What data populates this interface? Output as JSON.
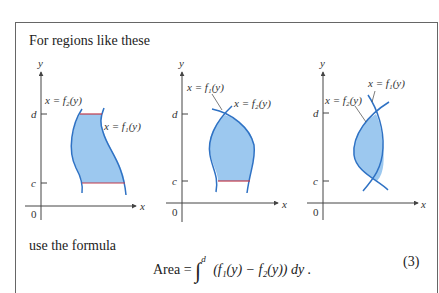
{
  "box": {
    "intro": "For regions like these",
    "use_line": "use the formula",
    "formula": {
      "lhs": "Area = ",
      "integral_upper": "d",
      "integral_lower": "c",
      "integrand": "(f₁(y) − f₂(y)) dy .",
      "equation_number": "(3)"
    }
  },
  "figures": [
    {
      "name": "figure-1",
      "axis_y_label": "y",
      "axis_x_label": "x",
      "origin_label": "0",
      "tick_d": "d",
      "tick_c": "c",
      "curve_labels": [
        "x = f₂(y)",
        "x = f₁(y)"
      ]
    },
    {
      "name": "figure-2",
      "axis_y_label": "y",
      "axis_x_label": "x",
      "origin_label": "0",
      "tick_d": "d",
      "tick_c": "c",
      "curve_labels": [
        "x = f₁(y)",
        "x = f₂(y)"
      ]
    },
    {
      "name": "figure-3",
      "axis_y_label": "y",
      "axis_x_label": "x",
      "origin_label": "0",
      "tick_d": "d",
      "tick_c": "c",
      "curve_labels": [
        "x = f₁(y)",
        "x = f₂(y)"
      ]
    }
  ],
  "colors": {
    "region_fill": "#9cc8ef",
    "curve": "#2f72c4",
    "boundary_segment": "#c0394a",
    "axis": "#444444"
  }
}
